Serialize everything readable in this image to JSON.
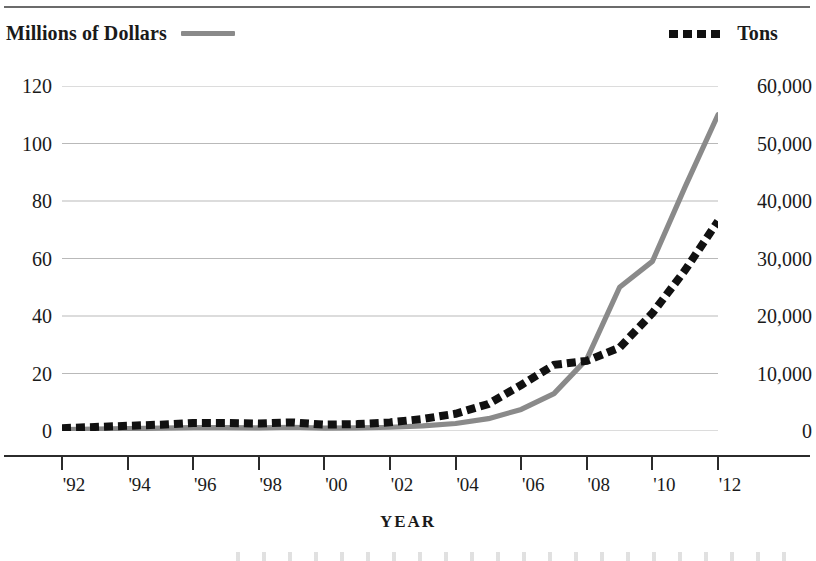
{
  "legend": {
    "dollars_label": "Millions of Dollars",
    "dollars_swatch": "solid-gray-line-icon",
    "tons_label": "Tons",
    "tons_swatch": "dotted-black-line-icon"
  },
  "axes": {
    "x_title": "YEAR",
    "x_ticks": [
      "'92",
      "'94",
      "'96",
      "'98",
      "'00",
      "'02",
      "'04",
      "'06",
      "'08",
      "'10",
      "'12"
    ],
    "y_left_ticks": [
      "0",
      "20",
      "40",
      "60",
      "80",
      "100",
      "120"
    ],
    "y_right_ticks": [
      "0",
      "10,000",
      "20,000",
      "30,000",
      "40,000",
      "50,000",
      "60,000"
    ]
  },
  "colors": {
    "dollars_line": "#8a8a8a",
    "tons_line": "#111111",
    "gridline": "#b9b9b9",
    "axis": "#2b2b2b",
    "text": "#1a1a1a"
  },
  "chart_data": {
    "type": "line",
    "title": "",
    "subtitle": "",
    "xlabel": "YEAR",
    "ylabel": "Millions of Dollars",
    "y2label": "Tons",
    "grid": true,
    "legend_position": "top",
    "x": [
      1992,
      1993,
      1994,
      1995,
      1996,
      1997,
      1998,
      1999,
      2000,
      2001,
      2002,
      2003,
      2004,
      2005,
      2006,
      2007,
      2008,
      2009,
      2010,
      2011,
      2012
    ],
    "x_tick_labels": [
      "'92",
      "'94",
      "'96",
      "'98",
      "'00",
      "'02",
      "'04",
      "'06",
      "'08",
      "'10",
      "'12"
    ],
    "xlim": [
      1992,
      2012
    ],
    "ylim": [
      0,
      120
    ],
    "y2lim": [
      0,
      60000
    ],
    "y_ticks": [
      0,
      20,
      40,
      60,
      80,
      100,
      120
    ],
    "y2_ticks": [
      0,
      10000,
      20000,
      30000,
      40000,
      50000,
      60000
    ],
    "series": [
      {
        "name": "Millions of Dollars",
        "axis": "left",
        "style": "solid",
        "color": "#8a8a8a",
        "values": [
          0.5,
          0.7,
          0.8,
          1.0,
          1.2,
          1.2,
          1.1,
          1.3,
          1.0,
          1.1,
          1.3,
          1.8,
          2.6,
          4.3,
          7.5,
          13.0,
          25.0,
          50.0,
          59.0,
          85.0,
          110.0
        ]
      },
      {
        "name": "Tons",
        "axis": "right",
        "style": "dotted",
        "color": "#111111",
        "values": [
          500,
          700,
          900,
          1100,
          1400,
          1400,
          1300,
          1500,
          1100,
          1200,
          1500,
          2100,
          3000,
          4700,
          8000,
          11500,
          12200,
          14500,
          20500,
          28000,
          36500
        ]
      }
    ]
  }
}
